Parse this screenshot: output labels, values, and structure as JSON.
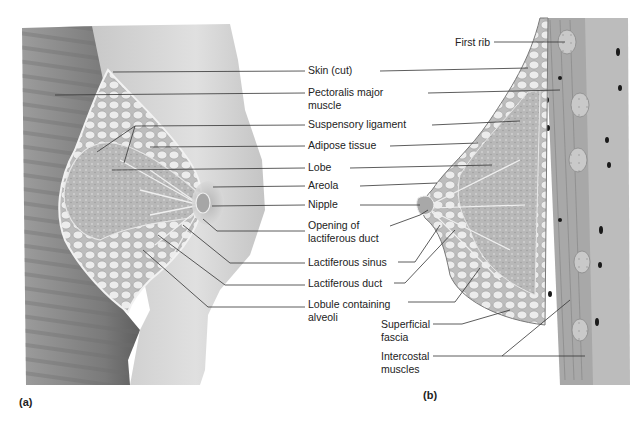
{
  "figure": {
    "panels": [
      {
        "id": "a",
        "tag": "(a)",
        "view": "anterolateral cutaway of breast"
      },
      {
        "id": "b",
        "tag": "(b)",
        "view": "sagittal section of breast and chest wall"
      }
    ],
    "labels_a": [
      {
        "id": "skin",
        "text": "Skin (cut)",
        "x": 308,
        "y": 38
      },
      {
        "id": "pectoralis",
        "line1": "Pectoralis major",
        "line2": "muscle",
        "x": 308,
        "y": 58
      },
      {
        "id": "suspensory",
        "text": "Suspensory ligament",
        "x": 308,
        "y": 89
      },
      {
        "id": "adipose",
        "text": "Adipose tissue",
        "x": 308,
        "y": 109
      },
      {
        "id": "lobe",
        "text": "Lobe",
        "x": 308,
        "y": 130
      },
      {
        "id": "areola",
        "text": "Areola",
        "x": 308,
        "y": 150
      },
      {
        "id": "nipple",
        "text": "Nipple",
        "x": 308,
        "y": 170
      },
      {
        "id": "opening",
        "line1": "Opening of",
        "line2": "lactiferous duct",
        "x": 308,
        "y": 195
      },
      {
        "id": "sinus",
        "text": "Lactiferous sinus",
        "x": 308,
        "y": 225
      },
      {
        "id": "duct",
        "text": "Lactiferous duct",
        "x": 308,
        "y": 247
      },
      {
        "id": "lobule",
        "line1": "Lobule containing",
        "line2": "alveoli",
        "x": 308,
        "y": 268
      }
    ],
    "labels_b": [
      {
        "id": "first-rib",
        "text": "First rib",
        "x": 456,
        "y": 9
      },
      {
        "id": "superficial-fascia",
        "line1": "Superficial",
        "line2": "fascia",
        "x": 380,
        "y": 290
      },
      {
        "id": "intercostal",
        "line1": "Intercostal",
        "line2": "muscles",
        "x": 380,
        "y": 325
      }
    ],
    "colors": {
      "background": "#ffffff",
      "muscle": "#8a8a8a",
      "skin": "#d2d2d2",
      "fat": "#e8e8e8",
      "gland": "#b4b4b4",
      "leader": "#333333",
      "text": "#222222"
    }
  }
}
